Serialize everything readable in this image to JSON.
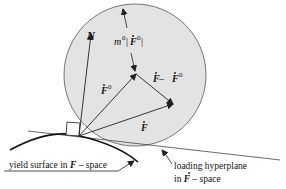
{
  "diagram": {
    "labels": {
      "normal": "N",
      "radius": "m⁰|Ḟ⁰|",
      "radius_m": "m",
      "radius_sup": "0",
      "radius_F": "F",
      "radius_F_sup": "0",
      "f0": "F",
      "f0_sup": "0",
      "diff_a": "F",
      "diff_minus": " – ",
      "diff_b": "F",
      "diff_b_sup": "0",
      "f": "F",
      "yield_text": "yield surface in ",
      "yield_F": "F",
      "yield_tail": " – space",
      "hyper_line1": "loading hyperplane",
      "hyper_in": "in ",
      "hyper_F": "F",
      "hyper_tail": " – space"
    },
    "colors": {
      "circle_fill": "#e3e3e3",
      "stroke": "#222222"
    }
  }
}
